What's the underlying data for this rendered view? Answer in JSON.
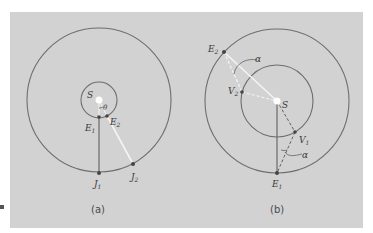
{
  "figure": {
    "background_color": "#d2d2d2",
    "orbit_color": "#6e6e6e",
    "line_dark": "#555555",
    "line_light": "#f4f4f4",
    "panel_a": {
      "caption": "(a)",
      "sun_label": "S",
      "angle_label": "θ",
      "points": {
        "E1": {
          "label": "E",
          "sub": "1"
        },
        "E2": {
          "label": "E",
          "sub": "2"
        },
        "J1": {
          "label": "J",
          "sub": "1"
        },
        "J2": {
          "label": "J",
          "sub": "2"
        }
      }
    },
    "panel_b": {
      "caption": "(b)",
      "sun_label": "S",
      "angle_label_top": "α",
      "angle_label_bottom": "α",
      "points": {
        "E1": {
          "label": "E",
          "sub": "1"
        },
        "E2": {
          "label": "E",
          "sub": "2"
        },
        "V1": {
          "label": "V",
          "sub": "1"
        },
        "V2": {
          "label": "V",
          "sub": "2"
        }
      }
    }
  }
}
